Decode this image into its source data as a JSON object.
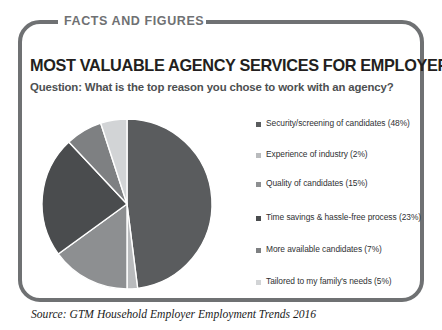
{
  "card": {
    "eyebrow": "FACTS AND FIGURES",
    "title": "MOST VALUABLE AGENCY SERVICES FOR EMPLOYERS",
    "subtitle": "Question: What is the top reason you chose to work with an agency?",
    "source": "Source: GTM Household Employer Employment Trends 2016",
    "frame_color": "#6f7173",
    "eyebrow_color": "#6f7173",
    "title_color": "#231f20",
    "subtitle_color": "#4d4f51"
  },
  "chart_data": {
    "type": "pie",
    "title": "MOST VALUABLE AGENCY SERVICES FOR EMPLOYERS",
    "subtitle": "Question: What is the top reason you chose to work with an agency?",
    "legend_position": "right",
    "start_angle_deg": 0,
    "direction": "clockwise",
    "categories": [
      "Security/screening of candidates",
      "Experience of industry",
      "Quality of candidates",
      "Time savings & hassle-free process",
      "More available candidates",
      "Tailored to my family's needs"
    ],
    "values": [
      48,
      2,
      15,
      23,
      7,
      5
    ],
    "unit": "%",
    "colors": [
      "#5a5c5e",
      "#b9bbbd",
      "#8d8f91",
      "#4a4c4e",
      "#7e8082",
      "#d2d4d6"
    ],
    "slices": [
      {
        "label": "Security/screening of candidates",
        "value": 48,
        "color": "#5a5c5e"
      },
      {
        "label": "Experience of industry",
        "value": 2,
        "color": "#b9bbbd"
      },
      {
        "label": "Quality of candidates",
        "value": 15,
        "color": "#8d8f91"
      },
      {
        "label": "Time savings & hassle-free process",
        "value": 23,
        "color": "#4a4c4e"
      },
      {
        "label": "More available candidates",
        "value": 7,
        "color": "#7e8082"
      },
      {
        "label": "Tailored to my family's needs",
        "value": 5,
        "color": "#d2d4d6"
      }
    ]
  },
  "legend": {
    "items": [
      {
        "text": "Security/screening of candidates (48%)",
        "color": "#5a5c5e",
        "top": 0
      },
      {
        "text": "Experience of industry (2%)",
        "color": "#b9bbbd",
        "top": 31
      },
      {
        "text": "Quality of candidates (15%)",
        "color": "#8d8f91",
        "top": 60
      },
      {
        "text": "Time savings & hassle-free process (23%)",
        "color": "#4a4c4e",
        "top": 94
      },
      {
        "text": "More available candidates (7%)",
        "color": "#7e8082",
        "top": 126
      },
      {
        "text": "Tailored to my family's needs (5%)",
        "color": "#d2d4d6",
        "top": 158
      }
    ]
  }
}
